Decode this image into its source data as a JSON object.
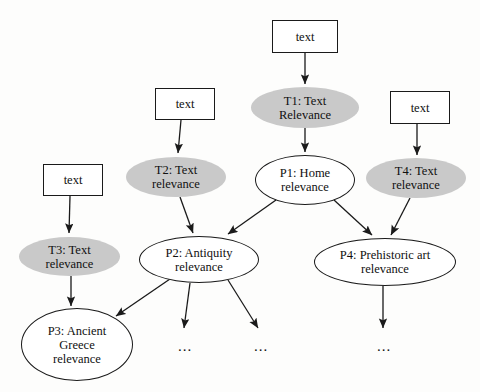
{
  "diagram": {
    "colors": {
      "shaded_fill": "#c9c9c9",
      "open_fill": "#ffffff",
      "stroke": "#1a1a1a",
      "text": "#101010",
      "background": "#fdfdfc"
    },
    "nodes": [
      {
        "id": "text1",
        "label": "text",
        "shape": "box",
        "x": 272,
        "y": 20,
        "w": 66,
        "h": 33
      },
      {
        "id": "text2",
        "label": "text",
        "shape": "box",
        "x": 155,
        "y": 88,
        "w": 60,
        "h": 32
      },
      {
        "id": "text4",
        "label": "text",
        "shape": "box",
        "x": 390,
        "y": 91,
        "w": 60,
        "h": 33
      },
      {
        "id": "text3",
        "label": "text",
        "shape": "box",
        "x": 43,
        "y": 164,
        "w": 60,
        "h": 32
      },
      {
        "id": "T1",
        "label": "T1: Text\nRelevance",
        "shape": "ellipse-shaded",
        "x": 251,
        "y": 87,
        "w": 108,
        "h": 41
      },
      {
        "id": "T2",
        "label": "T2: Text\nrelevance",
        "shape": "ellipse-shaded",
        "x": 126,
        "y": 157,
        "w": 100,
        "h": 40
      },
      {
        "id": "T4",
        "label": "T4: Text\nrelevance",
        "shape": "ellipse-shaded",
        "x": 366,
        "y": 158,
        "w": 100,
        "h": 40
      },
      {
        "id": "T3",
        "label": "T3: Text\nrelevance",
        "shape": "ellipse-shaded",
        "x": 19,
        "y": 237,
        "w": 101,
        "h": 39
      },
      {
        "id": "P1",
        "label": "P1: Home\nrelevance",
        "shape": "ellipse-open",
        "x": 255,
        "y": 155,
        "w": 100,
        "h": 50
      },
      {
        "id": "P2",
        "label": "P2: Antiquity\nrelevance",
        "shape": "ellipse-open",
        "x": 139,
        "y": 236,
        "w": 120,
        "h": 47
      },
      {
        "id": "P4",
        "label": "P4: Prehistoric art\nrelevance",
        "shape": "ellipse-open",
        "x": 314,
        "y": 238,
        "w": 142,
        "h": 48
      },
      {
        "id": "P3",
        "label": "P3: Ancient\nGreece\nrelevance",
        "shape": "ellipse-open",
        "x": 21,
        "y": 308,
        "w": 112,
        "h": 73
      }
    ],
    "ellipsis_markers": [
      {
        "id": "dots-p2-a",
        "label": "...",
        "x": 178,
        "y": 338
      },
      {
        "id": "dots-p2-b",
        "label": "...",
        "x": 254,
        "y": 338
      },
      {
        "id": "dots-p4",
        "label": "...",
        "x": 377,
        "y": 338
      }
    ],
    "edges": [
      {
        "id": "text1-T1",
        "from": "text1",
        "to": "T1",
        "x1": 305,
        "y1": 53,
        "x2": 305,
        "y2": 84
      },
      {
        "id": "text2-T2",
        "from": "text2",
        "to": "T2",
        "x1": 181,
        "y1": 120,
        "x2": 178,
        "y2": 153
      },
      {
        "id": "text4-T4",
        "from": "text4",
        "to": "T4",
        "x1": 417,
        "y1": 124,
        "x2": 417,
        "y2": 155
      },
      {
        "id": "text3-T3",
        "from": "text3",
        "to": "T3",
        "x1": 70,
        "y1": 196,
        "x2": 69,
        "y2": 233
      },
      {
        "id": "T1-P1",
        "from": "T1",
        "to": "P1",
        "x1": 305,
        "y1": 128,
        "x2": 305,
        "y2": 152
      },
      {
        "id": "T2-P2",
        "from": "T2",
        "to": "P2",
        "x1": 180,
        "y1": 197,
        "x2": 193,
        "y2": 233
      },
      {
        "id": "T4-P4",
        "from": "T4",
        "to": "P4",
        "x1": 410,
        "y1": 198,
        "x2": 391,
        "y2": 235
      },
      {
        "id": "T3-P3",
        "from": "T3",
        "to": "P3",
        "x1": 71,
        "y1": 276,
        "x2": 71,
        "y2": 306
      },
      {
        "id": "P1-P2",
        "from": "P1",
        "to": "P2",
        "x1": 276,
        "y1": 200,
        "x2": 228,
        "y2": 234
      },
      {
        "id": "P1-P4",
        "from": "P1",
        "to": "P4",
        "x1": 334,
        "y1": 200,
        "x2": 372,
        "y2": 235
      },
      {
        "id": "P2-P3",
        "from": "P2",
        "to": "P3",
        "x1": 170,
        "y1": 279,
        "x2": 116,
        "y2": 316
      },
      {
        "id": "P2-dots-a",
        "from": "P2",
        "to": "dots-p2-a",
        "x1": 190,
        "y1": 283,
        "x2": 184,
        "y2": 328
      },
      {
        "id": "P2-dots-b",
        "from": "P2",
        "to": "dots-p2-b",
        "x1": 228,
        "y1": 280,
        "x2": 258,
        "y2": 328
      },
      {
        "id": "P4-dots",
        "from": "P4",
        "to": "dots-p4",
        "x1": 383,
        "y1": 286,
        "x2": 383,
        "y2": 328
      }
    ]
  }
}
